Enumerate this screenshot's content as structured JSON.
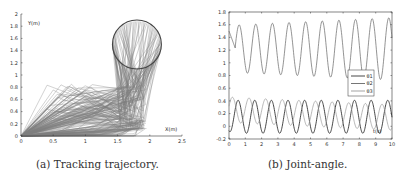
{
  "chart_data": [
    {
      "type": "line",
      "title": "",
      "caption": "(a) Tracking trajectory.",
      "xlabel": "X(m)",
      "ylabel": "Y(m)",
      "xlim": [
        0,
        2.5
      ],
      "ylim": [
        0,
        2
      ],
      "xticks": [
        "0",
        "0.5",
        "1",
        "1.5",
        "2",
        "2.5"
      ],
      "yticks": [
        "0",
        "0.2",
        "0.4",
        "0.6",
        "0.8",
        "1",
        "1.2",
        "1.4",
        "1.6",
        "1.8",
        "2"
      ],
      "grid": false,
      "description": "Stick diagram of a 3-link manipulator tracking a circular trajectory centered near (1.8, 1.5) with radius ~0.38 m; base at origin",
      "circle": {
        "cx": 1.8,
        "cy": 1.5,
        "r": 0.38
      },
      "series": [
        {
          "name": "link traces",
          "color": "#555555"
        },
        {
          "name": "target circle",
          "color": "#444444"
        }
      ]
    },
    {
      "type": "line",
      "title": "",
      "caption": "(b) Joint-angle.",
      "xlabel": "t(s)",
      "ylabel": "",
      "xlim": [
        0,
        10
      ],
      "ylim": [
        -0.2,
        1.8
      ],
      "xticks": [
        "0",
        "1",
        "2",
        "3",
        "4",
        "5",
        "6",
        "7",
        "8",
        "9",
        "10"
      ],
      "yticks": [
        "-0.2",
        "0",
        "0.2",
        "0.4",
        "0.6",
        "0.8",
        "1",
        "1.2",
        "1.4",
        "1.6",
        "1.8"
      ],
      "grid": false,
      "legend": {
        "position": "right-middle",
        "entries": [
          "θ1",
          "θ2",
          "θ3"
        ]
      },
      "x": [
        0,
        0.5,
        1,
        1.5,
        2,
        2.5,
        3,
        3.5,
        4,
        4.5,
        5,
        5.5,
        6,
        6.5,
        7,
        7.5,
        8,
        8.5,
        9,
        9.5,
        10
      ],
      "series": [
        {
          "name": "θ1",
          "color": "#333333",
          "description": "oscillates ~ -0.1 to 0.4, period ~1s",
          "values": [
            0.2,
            -0.1,
            0.35,
            -0.1,
            0.38,
            -0.08,
            0.38,
            -0.05,
            0.4,
            -0.05,
            0.4,
            -0.03,
            0.42,
            -0.02,
            0.42,
            0.0,
            0.43,
            0.0,
            0.44,
            0.02,
            0.45
          ]
        },
        {
          "name": "θ2",
          "color": "#666666",
          "description": "oscillates ~0.85 to 1.7, period ~1s, slowly growing amplitude",
          "values": [
            1.5,
            1.58,
            0.85,
            1.6,
            0.85,
            1.62,
            0.85,
            1.63,
            0.87,
            1.65,
            0.88,
            1.66,
            0.88,
            1.68,
            0.9,
            1.7,
            0.9,
            1.71,
            0.9,
            1.73,
            0.92
          ]
        },
        {
          "name": "θ3",
          "color": "#888888",
          "description": "oscillates ~0.0 to 0.48, period ~1s, drifting down",
          "values": [
            0.4,
            0.48,
            0.15,
            0.45,
            0.12,
            0.42,
            0.12,
            0.4,
            0.1,
            0.38,
            0.1,
            0.35,
            0.08,
            0.32,
            0.05,
            0.3,
            0.05,
            0.28,
            0.02,
            0.25,
            0.25
          ]
        }
      ]
    }
  ],
  "captions": {
    "left": "(a) Tracking trajectory.",
    "right": "(b) Joint-angle."
  },
  "left_plot": {
    "xlabel": "X(m)",
    "ylabel": "Y(m)",
    "xticks": [
      "0",
      "0.5",
      "1",
      "1.5",
      "2",
      "2.5"
    ],
    "yticks": [
      "0",
      "0.2",
      "0.4",
      "0.6",
      "0.8",
      "1",
      "1.2",
      "1.4",
      "1.6",
      "1.8",
      "2"
    ]
  },
  "right_plot": {
    "xlabel": "t(s)",
    "xticks": [
      "0",
      "1",
      "2",
      "3",
      "4",
      "5",
      "6",
      "7",
      "8",
      "9",
      "10"
    ],
    "yticks": [
      "-0.2",
      "0",
      "0.2",
      "0.4",
      "0.6",
      "0.8",
      "1",
      "1.2",
      "1.4",
      "1.6",
      "1.8"
    ],
    "legend": [
      "θ1",
      "θ2",
      "θ3"
    ]
  }
}
